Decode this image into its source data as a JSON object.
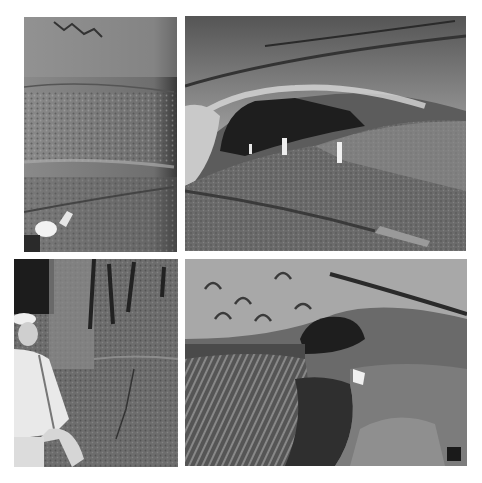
{
  "layout": {
    "background": "#ffffff",
    "grid": "2x2"
  },
  "photos": [
    {
      "id": "p1",
      "subject": "cave wall with layered sediment and caver with helmet lamp",
      "tone": "grayscale"
    },
    {
      "id": "p2",
      "subject": "large cave passage with three standing figures under arched ceiling",
      "tone": "grayscale"
    },
    {
      "id": "p3",
      "subject": "caver in white helmet and light clothing seated beside fluted cave wall",
      "tone": "grayscale"
    },
    {
      "id": "p4",
      "subject": "scalloped cave ceiling and eroded floor channel with caver crawling",
      "tone": "grayscale"
    }
  ]
}
